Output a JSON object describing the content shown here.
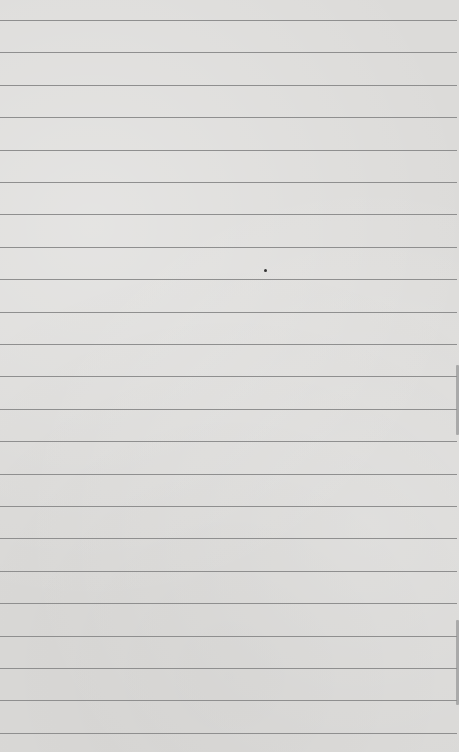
{
  "page": {
    "type": "blank-lined-paper",
    "background_color": "#dcdbd9",
    "line_color": "#8f8f8f",
    "first_line_y": 20,
    "line_spacing": 32.4,
    "line_count": 23,
    "marks": [
      {
        "kind": "dot",
        "x": 265,
        "y": 270
      }
    ]
  }
}
